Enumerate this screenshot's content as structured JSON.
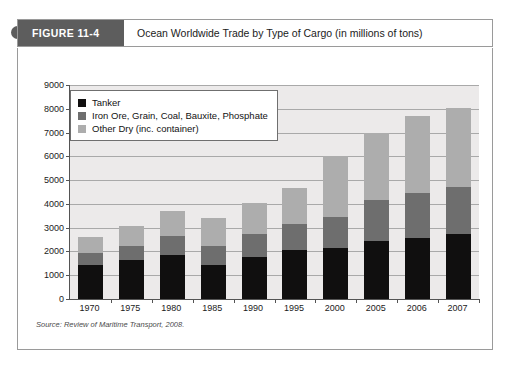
{
  "figure": {
    "tag": "FIGURE 11-4",
    "caption": "Ocean Worldwide Trade by Type of Cargo (in millions of tons)",
    "source": "Source: Review of Maritime Transport, 2008."
  },
  "colors": {
    "tanker": "#100f0f",
    "dry_bulk": "#6e6e6e",
    "other_dry": "#adadad",
    "plot_background": "#eceaea",
    "gridline": "#a9a9a9",
    "axis": "#545454",
    "tag_background": "#5d5d5d",
    "border": "#9a9a9a"
  },
  "chart_data": {
    "type": "bar",
    "stacked": true,
    "title": "Ocean Worldwide Trade by Type of Cargo (in millions of tons)",
    "xlabel": "",
    "ylabel": "",
    "ylim": [
      0,
      9000
    ],
    "ytick_step": 1000,
    "yticks": [
      9000,
      8000,
      7000,
      6000,
      5000,
      4000,
      3000,
      2000,
      1000,
      0
    ],
    "ytick_labels": [
      "9000",
      "8000",
      "7000",
      "6000",
      "5000",
      "4000",
      "3000",
      "2000",
      "1000",
      "0"
    ],
    "grid": true,
    "legend_position": "top-left",
    "categories": [
      "1970",
      "1975",
      "1980",
      "1985",
      "1990",
      "1995",
      "2000",
      "2005",
      "2006",
      "2007"
    ],
    "series": [
      {
        "name": "Tanker",
        "color": "#100f0f",
        "values": [
          1440,
          1650,
          1870,
          1450,
          1750,
          2050,
          2150,
          2420,
          2550,
          2750
        ]
      },
      {
        "name": "Iron Ore, Grain, Coal, Bauxite, Phosphate",
        "color": "#6e6e6e",
        "values": [
          510,
          600,
          790,
          800,
          970,
          1100,
          1300,
          1750,
          1900,
          1980
        ]
      },
      {
        "name": "Other Dry (inc. container)",
        "color": "#adadad",
        "values": [
          650,
          800,
          1050,
          1150,
          1300,
          1520,
          2550,
          2830,
          3250,
          3320
        ]
      }
    ],
    "totals": [
      2600,
      3050,
      3710,
      3400,
      4020,
      4670,
      6000,
      7000,
      7700,
      8050
    ]
  },
  "legend": {
    "items": [
      {
        "label": "Tanker",
        "swatch": "#100f0f"
      },
      {
        "label": "Iron Ore, Grain, Coal, Bauxite, Phosphate",
        "swatch": "#6e6e6e"
      },
      {
        "label": "Other Dry (inc. container)",
        "swatch": "#adadad"
      }
    ]
  }
}
